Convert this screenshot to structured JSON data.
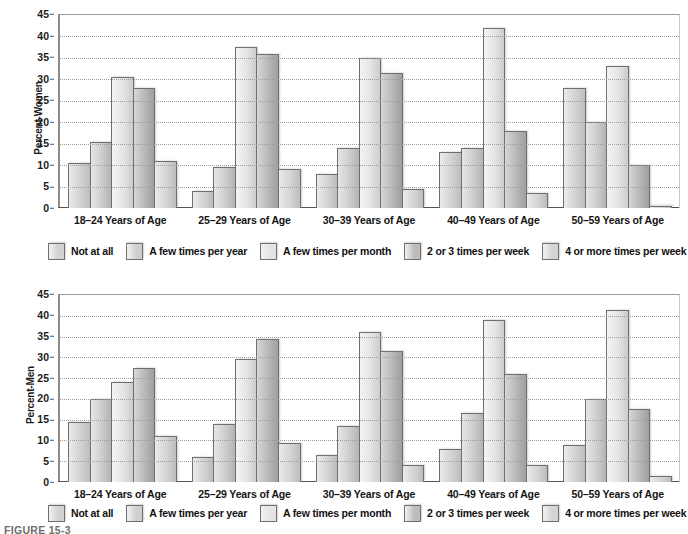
{
  "figure": {
    "caption": "FIGURE 15-3"
  },
  "legend": {
    "items": [
      {
        "label": "Not at all",
        "series_key": "not_at_all",
        "color": "#d2d2d2"
      },
      {
        "label": "A few times per year",
        "series_key": "few_per_year",
        "color": "#cfcfcf"
      },
      {
        "label": "A few times per month",
        "series_key": "few_per_month",
        "color": "#e4e4e4"
      },
      {
        "label": "2 or 3 times per week",
        "series_key": "two_three_per_week",
        "color": "#bdbdbd"
      },
      {
        "label": "4 or more times per week",
        "series_key": "four_plus_per_week",
        "color": "#d4d4d4"
      }
    ]
  },
  "chart_data": [
    {
      "id": "women",
      "type": "bar",
      "title": "",
      "ylabel": "Percent-Women",
      "xlabel": "",
      "ylim": [
        0,
        45
      ],
      "yticks": [
        0,
        5,
        10,
        15,
        20,
        25,
        30,
        35,
        40,
        45
      ],
      "grid": true,
      "legend_position": "bottom",
      "categories": [
        "18–24 Years of Age",
        "25–29 Years of Age",
        "30–39 Years of Age",
        "40–49 Years of Age",
        "50–59 Years of Age"
      ],
      "series": [
        {
          "name": "Not at all",
          "values": [
            10.5,
            4.0,
            8.0,
            13.0,
            28.0
          ]
        },
        {
          "name": "A few times per year",
          "values": [
            15.5,
            9.5,
            14.0,
            14.0,
            20.0
          ]
        },
        {
          "name": "A few times per month",
          "values": [
            30.5,
            37.5,
            35.0,
            42.0,
            33.0
          ]
        },
        {
          "name": "2 or 3 times per week",
          "values": [
            28.0,
            36.0,
            31.5,
            18.0,
            10.0
          ]
        },
        {
          "name": "4 or more times per week",
          "values": [
            11.0,
            9.0,
            4.5,
            3.5,
            0.5
          ]
        }
      ]
    },
    {
      "id": "men",
      "type": "bar",
      "title": "",
      "ylabel": "Percent-Men",
      "xlabel": "",
      "ylim": [
        0,
        45
      ],
      "yticks": [
        0,
        5,
        10,
        15,
        20,
        25,
        30,
        35,
        40,
        45
      ],
      "grid": true,
      "legend_position": "bottom",
      "categories": [
        "18–24 Years of Age",
        "25–29 Years of Age",
        "30–39 Years of Age",
        "40–49 Years of Age",
        "50–59 Years of Age"
      ],
      "series": [
        {
          "name": "Not at all",
          "values": [
            14.5,
            6.0,
            6.5,
            8.0,
            9.0
          ]
        },
        {
          "name": "A few times per year",
          "values": [
            20.0,
            14.0,
            13.5,
            16.5,
            20.0
          ]
        },
        {
          "name": "A few times per month",
          "values": [
            24.0,
            29.5,
            36.0,
            39.0,
            41.5
          ]
        },
        {
          "name": "2 or 3 times per week",
          "values": [
            27.5,
            34.5,
            31.5,
            26.0,
            17.5
          ]
        },
        {
          "name": "4 or more times per week",
          "values": [
            11.0,
            9.5,
            4.0,
            4.0,
            1.5
          ]
        }
      ]
    }
  ]
}
